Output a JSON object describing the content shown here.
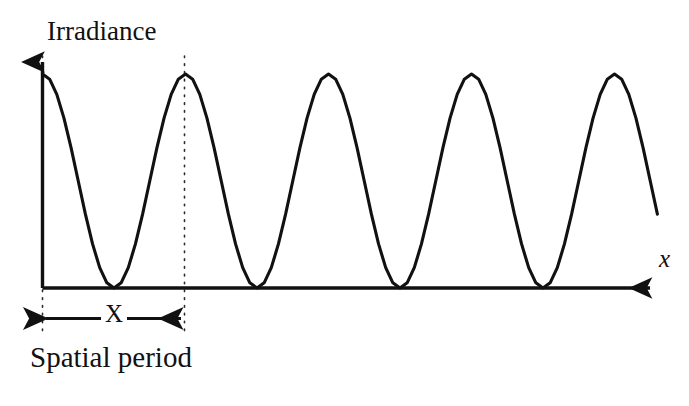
{
  "figure": {
    "y_axis_label": "Irradiance",
    "x_axis_label": "x",
    "period_symbol": "X",
    "period_caption": "Spatial period",
    "line_color": "#111111",
    "background_color": "#ffffff"
  },
  "chart_data": {
    "type": "line",
    "title": "",
    "xlabel": "x",
    "ylabel": "Irradiance",
    "grid": false,
    "legend": null,
    "axis_style": "arrow-axes",
    "function": "I(x) = Imax * cos^2(pi * x / X)",
    "spatial_period_px": 143,
    "peak_irradiance_relative": 1.0,
    "trough_irradiance_relative": 0.0,
    "xlim": [
      0,
      4.3
    ],
    "ylim": [
      0,
      1.0
    ],
    "peaks_x_period_units": [
      0,
      1,
      2,
      3,
      4
    ],
    "troughs_x_period_units": [
      0.5,
      1.5,
      2.5,
      3.5
    ],
    "annotations": [
      {
        "name": "period-dimension",
        "label": "X",
        "from_x_period_units": 0,
        "to_x_period_units": 1
      },
      {
        "name": "period-caption",
        "label": "Spatial period"
      }
    ],
    "guide_lines": [
      {
        "name": "guide-at-origin",
        "x_period_units": 0,
        "style": "dotted"
      },
      {
        "name": "guide-at-first-peak",
        "x_period_units": 1,
        "style": "dotted"
      }
    ],
    "x": [
      0.0,
      0.05,
      0.1,
      0.15,
      0.2,
      0.25,
      0.3,
      0.35,
      0.4,
      0.45,
      0.5,
      0.55,
      0.6,
      0.65,
      0.7,
      0.75,
      0.8,
      0.85,
      0.9,
      0.95,
      1.0,
      1.05,
      1.1,
      1.15,
      1.2,
      1.25,
      1.3,
      1.35,
      1.4,
      1.45,
      1.5,
      1.55,
      1.6,
      1.65,
      1.7,
      1.75,
      1.8,
      1.85,
      1.9,
      1.95,
      2.0,
      2.05,
      2.1,
      2.15,
      2.2,
      2.25,
      2.3,
      2.35,
      2.4,
      2.45,
      2.5,
      2.55,
      2.6,
      2.65,
      2.7,
      2.75,
      2.8,
      2.85,
      2.9,
      2.95,
      3.0,
      3.05,
      3.1,
      3.15,
      3.2,
      3.25,
      3.3,
      3.35,
      3.4,
      3.45,
      3.5,
      3.55,
      3.6,
      3.65,
      3.7,
      3.75,
      3.8,
      3.85,
      3.9,
      3.95,
      4.0,
      4.05,
      4.1,
      4.15,
      4.2,
      4.25,
      4.3
    ],
    "y": [
      1.0,
      0.976,
      0.905,
      0.794,
      0.655,
      0.5,
      0.345,
      0.206,
      0.095,
      0.024,
      0.0,
      0.024,
      0.095,
      0.206,
      0.345,
      0.5,
      0.655,
      0.794,
      0.905,
      0.976,
      1.0,
      0.976,
      0.905,
      0.794,
      0.655,
      0.5,
      0.345,
      0.206,
      0.095,
      0.024,
      0.0,
      0.024,
      0.095,
      0.206,
      0.345,
      0.5,
      0.655,
      0.794,
      0.905,
      0.976,
      1.0,
      0.976,
      0.905,
      0.794,
      0.655,
      0.5,
      0.345,
      0.206,
      0.095,
      0.024,
      0.0,
      0.024,
      0.095,
      0.206,
      0.345,
      0.5,
      0.655,
      0.794,
      0.905,
      0.976,
      1.0,
      0.976,
      0.905,
      0.794,
      0.655,
      0.5,
      0.345,
      0.206,
      0.095,
      0.024,
      0.0,
      0.024,
      0.095,
      0.206,
      0.345,
      0.5,
      0.655,
      0.794,
      0.905,
      0.976,
      1.0,
      0.976,
      0.905,
      0.794,
      0.655,
      0.5,
      0.345
    ]
  }
}
